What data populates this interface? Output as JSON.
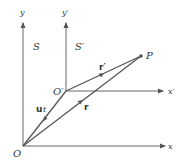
{
  "diagram": {
    "frames": {
      "S": {
        "label": "S",
        "origin": "O",
        "x_axis": "x",
        "y_axis": "y"
      },
      "S_prime": {
        "label": "S′",
        "origin": "O′",
        "x_axis": "x′",
        "y_axis": "y′"
      }
    },
    "point": "P",
    "vectors": {
      "ut": {
        "label_bold": "u",
        "label_italic": "t"
      },
      "r": {
        "label": "r"
      },
      "r_prime": {
        "label": "r′"
      }
    },
    "colors": {
      "line": "#555555",
      "text": "#333333",
      "background": "#ffffff"
    }
  }
}
